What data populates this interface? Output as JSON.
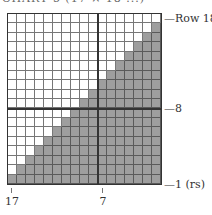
{
  "title": "CHART 5 (17 × 18 ...)",
  "chart_data": {
    "type": "heatmap",
    "title": "CHART 5 (17 × 18 ...)",
    "columns": 17,
    "rows": 18,
    "column_numbering": "right-to-left, 17 at left down to 1 at right",
    "row_numbering": "bottom-to-top, 1 (rs) at bottom up to 18 at top",
    "shading_rule": "row r has (r-1) white cells on the left; remaining cells shaded",
    "shaded_per_row": [
      17,
      16,
      15,
      14,
      13,
      12,
      11,
      10,
      9,
      8,
      7,
      6,
      5,
      4,
      3,
      2,
      1,
      0
    ],
    "white_per_row_from_row1": [
      0,
      1,
      2,
      3,
      4,
      5,
      6,
      7,
      8,
      9,
      10,
      11,
      12,
      13,
      14,
      15,
      16,
      17
    ],
    "emphasis_lines": {
      "vertical_after_column": 8,
      "horizontal_above_row": 8
    },
    "x_ticks": [
      "17",
      "7"
    ],
    "y_labels": [
      "Row 18",
      "8",
      "1 (rs)"
    ],
    "colors": {
      "shaded": "#9e9e9e",
      "empty": "#ffffff",
      "grid": "#777777",
      "emphasis": "#333333"
    }
  },
  "labels": {
    "row_top": "—Row 18",
    "row_mid": "—8",
    "row_bottom": "—1 (rs)",
    "col_left": "17",
    "col_mid": "7"
  }
}
